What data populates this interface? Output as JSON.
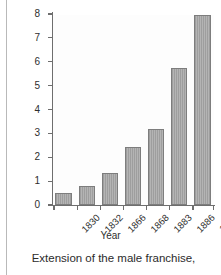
{
  "chart_data": {
    "type": "bar",
    "title": "",
    "xlabel": "Year",
    "ylabel": "Number of men eligible to vote (millions)",
    "categories": [
      "1830",
      "1832",
      "1866",
      "1868",
      "1883",
      "1886",
      "1911"
    ],
    "values": [
      0.5,
      0.8,
      1.35,
      2.45,
      3.2,
      5.75,
      7.95
    ],
    "ylim": [
      0,
      8
    ],
    "yticks": [
      "0",
      "1",
      "2",
      "3",
      "4",
      "5",
      "6",
      "7",
      "8"
    ],
    "grid": false,
    "legend": "none",
    "bar_color": "#a8a8a8",
    "axis_color": "#6e6e6e"
  },
  "caption": {
    "text": "Extension of the male franchise,"
  }
}
